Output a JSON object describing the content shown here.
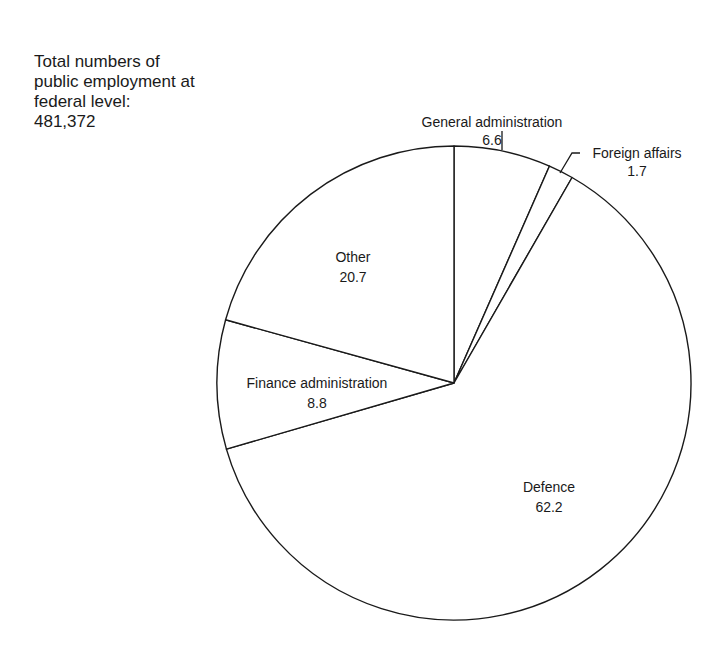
{
  "annotation": {
    "lines": [
      "Total numbers of",
      "public employment at",
      "federal level:",
      "481,372"
    ]
  },
  "chart_data": {
    "type": "pie",
    "title": "Total numbers of public employment at federal level: 481,372",
    "unit": "%",
    "start_angle_deg": 0,
    "direction": "clockwise",
    "categories": [
      "General administration",
      "Foreign affairs",
      "Defence",
      "Finance administration",
      "Other"
    ],
    "values": [
      6.6,
      1.7,
      62.2,
      8.8,
      20.7
    ],
    "labels": [
      {
        "name": "General administration",
        "value": "6.6"
      },
      {
        "name": "Foreign affairs",
        "value": "1.7"
      },
      {
        "name": "Defence",
        "value": "62.2"
      },
      {
        "name": "Finance administration",
        "value": "8.8"
      },
      {
        "name": "Other",
        "value": "20.7"
      }
    ],
    "colors": {
      "fill": "#ffffff",
      "stroke": "#1a1a1a"
    },
    "legend": "none"
  }
}
